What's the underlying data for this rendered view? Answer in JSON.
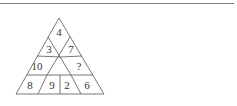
{
  "puzzle": {
    "type": "number-triangle",
    "cells": {
      "top": "4",
      "upper_left": "3",
      "upper_right": "7",
      "middle_left": "10",
      "middle_right": "?",
      "bottom_1": "8",
      "bottom_2": "9",
      "bottom_3": "2",
      "bottom_4": "6"
    }
  },
  "colors": {
    "line": "#555555",
    "text": "#333333",
    "rule": "#7a7a7a"
  }
}
